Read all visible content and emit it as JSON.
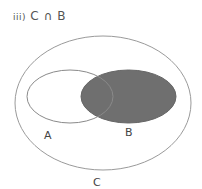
{
  "title": {
    "number": "iii)",
    "expression": "C ∩ B"
  },
  "sets": {
    "A": {
      "label": "A"
    },
    "B": {
      "label": "B",
      "shaded": true
    },
    "C": {
      "label": "C"
    }
  },
  "colors": {
    "shade": "#6f6f6f",
    "stroke": "#8a8a8a"
  }
}
